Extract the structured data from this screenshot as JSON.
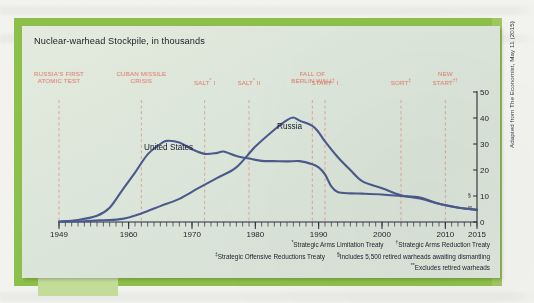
{
  "chart_title": "Nuclear-warhead Stockpile, in thousands",
  "attribution": "Adapted from The Economist, May 11 (2015)",
  "axes": {
    "x_ticks": [
      "1949",
      "1960",
      "1970",
      "1980",
      "1990",
      "2000",
      "2010",
      "2015"
    ],
    "y_ticks": [
      "0",
      "10",
      "20",
      "30",
      "40",
      "50"
    ],
    "y_marker_section": "§",
    "y_marker_double": "**"
  },
  "series_labels": {
    "us": "United States",
    "russia": "Russia"
  },
  "events": [
    {
      "name": "russias-first-atomic-test",
      "line1": "RUSSIA'S FIRST",
      "line2": "ATOMIC TEST",
      "year": 1949
    },
    {
      "name": "cuban-missile-crisis",
      "line1": "CUBAN MISSILE",
      "line2": "CRISIS",
      "year": 1962
    },
    {
      "name": "salt-1",
      "line1": "",
      "line2": "SALT* I",
      "year": 1972
    },
    {
      "name": "salt-2",
      "line1": "",
      "line2": "SALT* II",
      "year": 1979
    },
    {
      "name": "fall-of-berlin-wall",
      "line1": "FALL OF",
      "line2": "BERLIN WALL",
      "year": 1989
    },
    {
      "name": "start-1",
      "line1": "",
      "line2": "START† I",
      "year": 1991
    },
    {
      "name": "sort",
      "line1": "",
      "line2": "SORT‡",
      "year": 2003
    },
    {
      "name": "new-start",
      "line1": "NEW",
      "line2": "START††",
      "year": 2010
    }
  ],
  "footnotes": [
    {
      "marker": "*",
      "text": "Strategic Arms Limitation Treaty"
    },
    {
      "marker": "†",
      "text": "Strategic Arms Reduction Treaty"
    },
    {
      "marker": "‡",
      "text": "Strategic Offensive Reductions Treaty"
    },
    {
      "marker": "§",
      "text": "Includes 5,500 retired warheads awaiting dismantling"
    },
    {
      "marker": "**",
      "text": "Excludes retired warheads"
    }
  ],
  "colors": {
    "line": "#4a5a8c",
    "event_line": "#dd9a8c",
    "event_text": "#e08a7e",
    "frame_green": "#8dc04a",
    "card_bg": "#dde6da",
    "axis": "#2b2b3a"
  },
  "chart_data": {
    "type": "line",
    "title": "Nuclear-warhead Stockpile, in thousands",
    "xlabel": "",
    "ylabel": "thousands of warheads",
    "xlim": [
      1949,
      2015
    ],
    "ylim": [
      0,
      50
    ],
    "grid": false,
    "legend": "inline-series-labels",
    "series": [
      {
        "name": "United States",
        "x": [
          1949,
          1952,
          1955,
          1957,
          1959,
          1961,
          1963,
          1965,
          1966,
          1968,
          1970,
          1972,
          1974,
          1975,
          1977,
          1979,
          1981,
          1983,
          1985,
          1987,
          1989,
          1990,
          1991,
          1992,
          1993,
          1995,
          1997,
          2000,
          2003,
          2006,
          2009,
          2012,
          2015
        ],
        "values": [
          0.2,
          0.8,
          2.4,
          5.5,
          12.3,
          19.0,
          26.0,
          30.0,
          31.2,
          30.6,
          28.0,
          26.2,
          26.6,
          27.1,
          25.4,
          24.4,
          23.5,
          23.4,
          23.3,
          23.4,
          22.2,
          21.0,
          18.3,
          13.7,
          11.5,
          11.0,
          10.9,
          10.6,
          10.0,
          9.4,
          7.0,
          5.5,
          4.8
        ]
      },
      {
        "name": "Russia",
        "x": [
          1949,
          1953,
          1956,
          1959,
          1962,
          1965,
          1968,
          1971,
          1974,
          1977,
          1980,
          1983,
          1985,
          1986,
          1987,
          1989,
          1990,
          1991,
          1993,
          1995,
          1997,
          2000,
          2003,
          2006,
          2009,
          2012,
          2015
        ],
        "values": [
          0.1,
          0.3,
          0.7,
          1.2,
          3.3,
          6.1,
          8.9,
          13.0,
          17.0,
          21.0,
          29.0,
          35.5,
          39.2,
          40.2,
          39.0,
          37.0,
          34.5,
          31.0,
          25.0,
          20.0,
          15.5,
          13.0,
          10.3,
          9.0,
          7.0,
          5.6,
          4.6
        ]
      }
    ],
    "annotations": [
      {
        "label": "RUSSIA'S FIRST ATOMIC TEST",
        "x": 1949
      },
      {
        "label": "CUBAN MISSILE CRISIS",
        "x": 1962
      },
      {
        "label": "SALT* I",
        "x": 1972
      },
      {
        "label": "SALT* II",
        "x": 1979
      },
      {
        "label": "FALL OF BERLIN WALL",
        "x": 1989
      },
      {
        "label": "START† I",
        "x": 1991
      },
      {
        "label": "SORT‡",
        "x": 2003
      },
      {
        "label": "NEW START††",
        "x": 2010
      }
    ]
  }
}
